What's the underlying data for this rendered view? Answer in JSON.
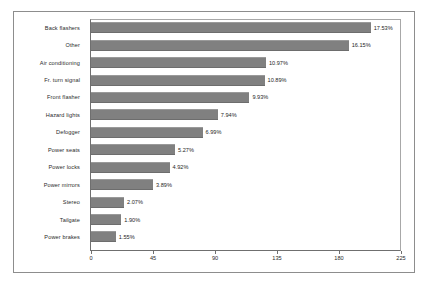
{
  "chart_data": {
    "type": "bar",
    "orientation": "horizontal",
    "title": "",
    "xlabel": "",
    "ylabel": "",
    "xlim": [
      0,
      225
    ],
    "xticks": [
      0,
      45,
      90,
      135,
      180,
      225
    ],
    "grid": false,
    "legend": null,
    "bar_color": "#808080",
    "categories": [
      "Back flashers",
      "Other",
      "Air conditioning",
      "Fr. turn signal",
      "Front flasher",
      "Hazard lights",
      "Defogger",
      "Power seats",
      "Power locks",
      "Power mirrors",
      "Stereo",
      "Tailgate",
      "Power brakes"
    ],
    "values": [
      203,
      187,
      127,
      126,
      115,
      92,
      81,
      61,
      57,
      45,
      24,
      22,
      18
    ],
    "data_labels": [
      "17.53%",
      "16.15%",
      "10.97%",
      "10.89%",
      "9.93%",
      "7.94%",
      "6.99%",
      "5.27%",
      "4.92%",
      "3.89%",
      "2.07%",
      "1.90%",
      "1.55%"
    ]
  }
}
